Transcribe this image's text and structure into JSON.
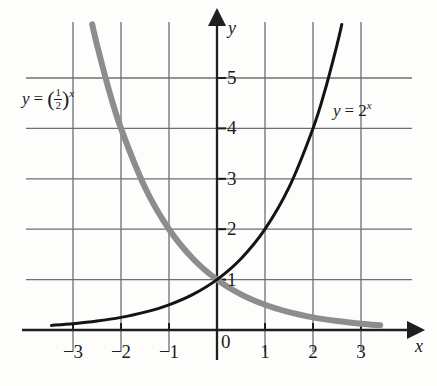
{
  "chart_data": {
    "type": "line",
    "title": "",
    "xlabel": "x",
    "ylabel": "y",
    "xlim": [
      -3.6,
      3.6
    ],
    "ylim": [
      -0.35,
      5.7
    ],
    "grid": true,
    "legend_position": "inline-annotation",
    "x_ticks": [
      -3,
      -2,
      -1,
      0,
      1,
      2,
      3
    ],
    "x_tick_labels": [
      "−3",
      "−2",
      "−1",
      "0",
      "1",
      "2",
      "3"
    ],
    "y_ticks": [
      1,
      2,
      3,
      4,
      5
    ],
    "y_tick_labels": [
      "1",
      "2",
      "3",
      "4",
      "5"
    ],
    "series": [
      {
        "name": "y = 2^x",
        "color": "#141414",
        "width": 3.0,
        "x": [
          -3.45,
          -3.0,
          -2.5,
          -2.0,
          -1.5,
          -1.0,
          -0.5,
          0.0,
          0.5,
          1.0,
          1.5,
          2.0,
          2.25,
          2.5,
          2.6
        ],
        "y": [
          0.0915,
          0.125,
          0.177,
          0.25,
          0.354,
          0.5,
          0.707,
          1.0,
          1.414,
          2.0,
          2.828,
          4.0,
          4.757,
          5.657,
          6.063
        ]
      },
      {
        "name": "y = (1/2)^x",
        "color": "#8d8d8d",
        "width": 6.0,
        "x": [
          -2.6,
          -2.5,
          -2.25,
          -2.0,
          -1.5,
          -1.0,
          -0.5,
          0.0,
          0.5,
          1.0,
          1.5,
          2.0,
          2.5,
          3.0,
          3.4
        ],
        "y": [
          6.063,
          5.657,
          4.757,
          4.0,
          2.828,
          2.0,
          1.414,
          1.0,
          0.707,
          0.5,
          0.354,
          0.25,
          0.177,
          0.125,
          0.0947
        ]
      }
    ],
    "annotations": [
      {
        "name": "half-power-label",
        "text_parts": {
          "lhs": "y",
          "eq": "=",
          "open": "(",
          "num": "1",
          "den": "2",
          "close": ")",
          "exp": "x"
        },
        "plain_text": "y = (1/2)^x",
        "x_px": 22,
        "y_px": 88
      },
      {
        "name": "two-power-label",
        "text_parts": {
          "lhs": "y",
          "eq": "=",
          "base": "2",
          "exp": "x"
        },
        "plain_text": "y = 2^x",
        "x_px": 333,
        "y_px": 100
      }
    ],
    "intersection_point": {
      "x": 0,
      "y": 1
    },
    "axis_color": "#1f1f1f",
    "grid_color": "#6f6f6f"
  },
  "axes": {
    "x_axis_label": "x",
    "y_axis_label": "y"
  }
}
